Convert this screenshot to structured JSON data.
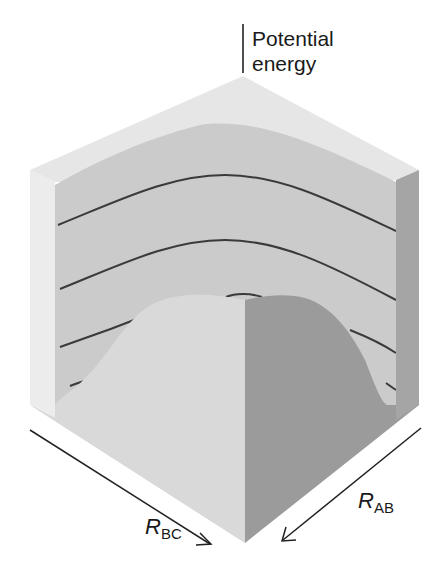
{
  "figure": {
    "type": "potential-energy-surface",
    "axis_vertical": {
      "label_line1": "Potential",
      "label_line2": "energy"
    },
    "axis_bc": {
      "symbol": "R",
      "subscript": "BC"
    },
    "axis_ab": {
      "symbol": "R",
      "subscript": "AB"
    },
    "contour_count": 4,
    "colors": {
      "top_face": "#e6e6e6",
      "left_edge_face": "#ececec",
      "back_wall": "#c9c9c9",
      "front_left_face": "#d8d8d8",
      "front_right_face": "#9a9a9a",
      "right_edge_face": "#a3a3a3",
      "contour_line": "#3a3a3a",
      "arrow": "#222222"
    }
  }
}
